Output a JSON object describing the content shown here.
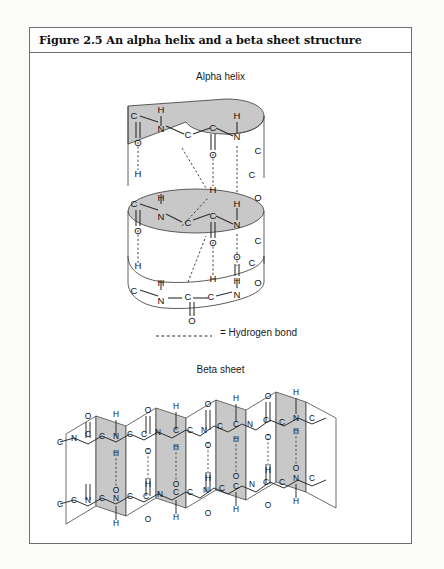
{
  "figure": {
    "title": "Figure 2.5 An alpha helix and a beta sheet structure",
    "alpha_label": "Alpha helix",
    "beta_label": "Beta sheet",
    "legend_label": "= Hydrogen bond"
  },
  "colors": {
    "page_background": "#fbfbfa",
    "frame_border": "#6e6e6e",
    "ribbon_fill": "#c8c8c8",
    "sheet_fill": "#c8c8c8",
    "line": "#3a3a3a",
    "text": "#111111"
  },
  "atoms": {
    "carbon": "C",
    "nitrogen": "N",
    "oxygen": "O",
    "hydrogen": "H"
  },
  "alpha_helix": {
    "turns": 3,
    "turn_1_labels": [
      "C",
      "H",
      "N",
      "C",
      "C",
      "H",
      "N",
      "O",
      "O"
    ],
    "turn_2_labels": [
      "C",
      "H",
      "N",
      "C",
      "C",
      "H",
      "N",
      "O",
      "O"
    ],
    "turn_3_labels": [
      "C",
      "H",
      "N",
      "C",
      "C",
      "H",
      "N",
      "O",
      "O"
    ],
    "bond_style": "hydrogen bonds shown as dashed lines"
  },
  "beta_sheet": {
    "strand_count": 2,
    "pleat_panels": 8,
    "repeat_labels": [
      "O",
      "H",
      "C",
      "N",
      "C",
      "C",
      "N",
      "C",
      "O",
      "H"
    ],
    "bond_style": "hydrogen bonds shown as vertical dashed lines"
  }
}
